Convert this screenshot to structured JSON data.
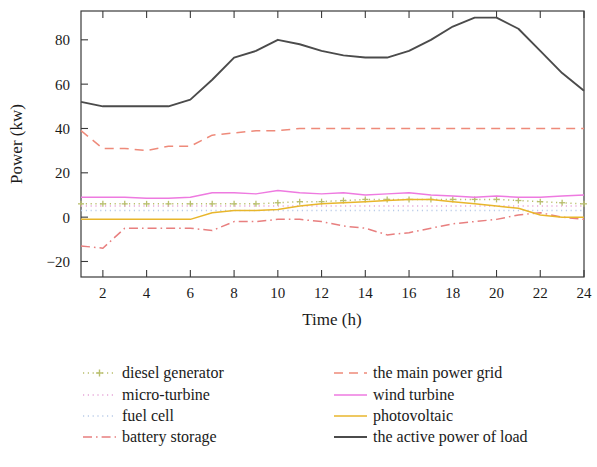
{
  "chart_data": {
    "type": "line",
    "title": "",
    "xlabel": "Time (h)",
    "ylabel": "Power (kw)",
    "xlim": [
      1,
      24
    ],
    "ylim": [
      -27,
      93
    ],
    "xticks": [
      2,
      4,
      6,
      8,
      10,
      12,
      14,
      16,
      18,
      20,
      22,
      24
    ],
    "yticks": [
      -20,
      0,
      20,
      40,
      60,
      80
    ],
    "grid": false,
    "legend_position": "below-plot",
    "x": [
      1,
      2,
      3,
      4,
      5,
      6,
      7,
      8,
      9,
      10,
      11,
      12,
      13,
      14,
      15,
      16,
      17,
      18,
      19,
      20,
      21,
      22,
      23,
      24
    ],
    "series": [
      {
        "name": "diesel generator",
        "color": "#b9bf6e",
        "style": "dotted-marker",
        "marker": "plus",
        "values": [
          6,
          6,
          6,
          6,
          6,
          6,
          6,
          6,
          6,
          6.5,
          7,
          7,
          7.5,
          8,
          8,
          8,
          8,
          8,
          8,
          8,
          7.5,
          7,
          6.5,
          6
        ]
      },
      {
        "name": "micro-turbine",
        "color": "#e6a6d8",
        "style": "dotted",
        "marker": "none",
        "values": [
          5,
          5,
          5,
          5,
          5,
          5,
          5,
          5,
          5,
          5,
          5,
          5,
          5,
          5,
          5,
          5,
          5,
          5,
          5,
          5,
          5,
          5,
          5,
          5
        ]
      },
      {
        "name": "fuel cell",
        "color": "#b9cbe8",
        "style": "dotted",
        "marker": "none",
        "values": [
          3,
          3,
          3,
          3,
          3,
          3,
          3,
          3,
          3,
          3,
          3,
          3,
          3,
          3,
          3,
          3,
          3,
          3,
          3,
          3,
          3,
          3,
          3,
          3
        ]
      },
      {
        "name": "battery storage",
        "color": "#e87f7f",
        "style": "dash-dot",
        "marker": "none",
        "values": [
          -13,
          -14,
          -5,
          -5,
          -5,
          -5,
          -6,
          -2,
          -2,
          -1,
          -1,
          -2,
          -4,
          -5,
          -8,
          -7,
          -5,
          -3,
          -2,
          -1,
          1,
          2,
          0,
          -1
        ]
      },
      {
        "name": "the main power grid",
        "color": "#ee8a7a",
        "style": "dashed",
        "marker": "none",
        "values": [
          39,
          31,
          31,
          30,
          32,
          32,
          37,
          38,
          39,
          39,
          40,
          40,
          40,
          40,
          40,
          40,
          40,
          40,
          40,
          40,
          40,
          40,
          40,
          40
        ]
      },
      {
        "name": "wind turbine",
        "color": "#ee7ae0",
        "style": "solid",
        "marker": "none",
        "values": [
          9,
          9,
          9,
          8.5,
          8.5,
          9,
          11,
          11,
          10.5,
          12,
          11,
          10.5,
          11,
          10,
          10.5,
          11,
          10,
          9.5,
          9,
          9.5,
          9,
          9,
          9.5,
          10
        ]
      },
      {
        "name": "photovoltaic",
        "color": "#e8b62c",
        "style": "solid",
        "marker": "none",
        "values": [
          -1,
          -1,
          -1,
          -1,
          -1,
          -1,
          2,
          3,
          3,
          3.5,
          5,
          6,
          6.5,
          7,
          7.5,
          8,
          8,
          7,
          6,
          5,
          4,
          1,
          0,
          0
        ]
      },
      {
        "name": "the active power of load",
        "color": "#4b4b4b",
        "style": "solid",
        "marker": "none",
        "values": [
          52,
          50,
          50,
          50,
          50,
          53,
          62,
          72,
          75,
          80,
          78,
          75,
          73,
          72,
          72,
          75,
          80,
          86,
          90,
          90,
          85,
          75,
          65,
          57
        ]
      }
    ]
  },
  "legend": {
    "column_left": [
      {
        "label": "diesel generator",
        "series_index": 0
      },
      {
        "label": "micro-turbine",
        "series_index": 1
      },
      {
        "label": "fuel cell",
        "series_index": 2
      },
      {
        "label": "battery storage",
        "series_index": 3
      }
    ],
    "column_right": [
      {
        "label": "the main power grid",
        "series_index": 4
      },
      {
        "label": "wind turbine",
        "series_index": 5
      },
      {
        "label": "photovoltaic",
        "series_index": 6
      },
      {
        "label": "the active power of load",
        "series_index": 7
      }
    ]
  }
}
